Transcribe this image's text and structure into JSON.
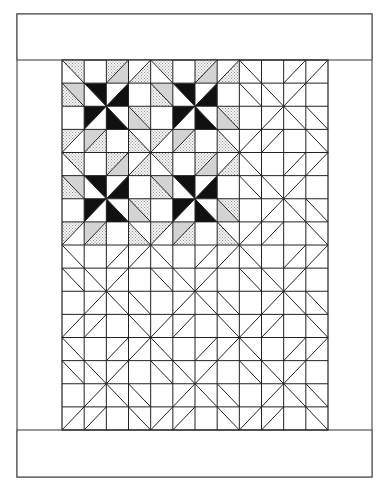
{
  "diagram": {
    "type": "quilt-layout",
    "canvas": {
      "width": 389,
      "height": 494
    },
    "outer_border": {
      "x": 17,
      "y": 14,
      "width": 355,
      "height": 463
    },
    "top_band": {
      "x": 17,
      "y": 14,
      "width": 355,
      "height": 46
    },
    "bottom_band": {
      "x": 17,
      "y": 430,
      "width": 355,
      "height": 47
    },
    "grid": {
      "x": 62,
      "y": 60,
      "width": 266,
      "height": 370,
      "cols": 12,
      "rows": 16,
      "block_size": 4,
      "colored_region": {
        "col_start": 0,
        "col_end": 8,
        "row_start": 0,
        "row_end": 8
      }
    },
    "block_pattern": {
      "legend": "d = diagonal ('\\\\' = top-left to bottom-right, '/' = top-right to bottom-left, '' = none); a/b = fill of the two triangles (for '\\\\': a=upper-right, b=lower-left; for '/': a=upper-left, b=lower-right)",
      "cells": [
        [
          {
            "d": "\\",
            "a": "dot",
            "b": "white"
          },
          {
            "d": "",
            "a": "white",
            "b": "white"
          },
          {
            "d": "/",
            "a": "dot",
            "b": "gray"
          },
          {
            "d": "/",
            "a": "white",
            "b": "dot"
          }
        ],
        [
          {
            "d": "\\",
            "a": "gray",
            "b": "dot"
          },
          {
            "d": "\\",
            "a": "black",
            "b": "white"
          },
          {
            "d": "/",
            "a": "white",
            "b": "black"
          },
          {
            "d": "",
            "a": "white",
            "b": "white"
          }
        ],
        [
          {
            "d": "",
            "a": "white",
            "b": "white"
          },
          {
            "d": "/",
            "a": "black",
            "b": "white"
          },
          {
            "d": "\\",
            "a": "white",
            "b": "black"
          },
          {
            "d": "\\",
            "a": "dot",
            "b": "gray"
          }
        ],
        [
          {
            "d": "/",
            "a": "dot",
            "b": "white"
          },
          {
            "d": "/",
            "a": "gray",
            "b": "dot"
          },
          {
            "d": "",
            "a": "white",
            "b": "white"
          },
          {
            "d": "\\",
            "a": "white",
            "b": "dot"
          }
        ]
      ]
    },
    "colors": {
      "line": "#222222",
      "border_line": "#555555",
      "white": "#ffffff",
      "gray": "#d3d3d3",
      "black": "#111111",
      "dot_bg": "#f4f4f4",
      "dot_fg": "#9a9a9a"
    }
  }
}
